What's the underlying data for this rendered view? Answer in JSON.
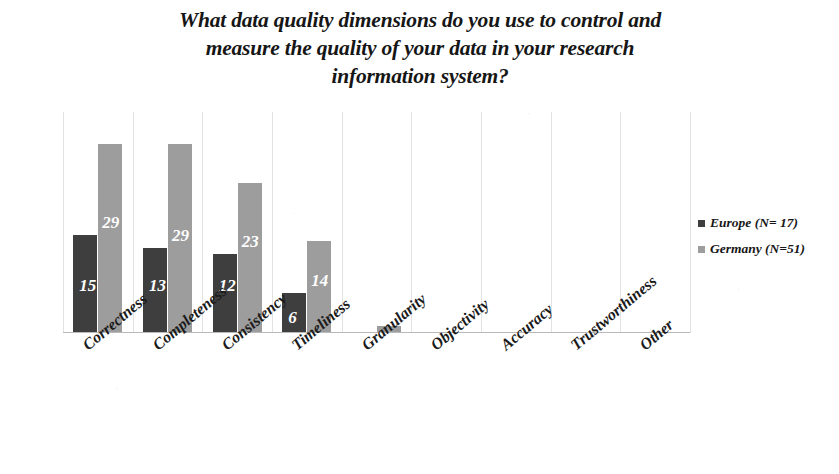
{
  "chart_data": {
    "type": "bar",
    "title": "What data quality dimensions do you use to control and\nmeasure the quality of your data in your research\ninformation system?",
    "xlabel": "",
    "ylabel": "",
    "ylim": [
      0,
      34
    ],
    "grid": "vertical-category-separators",
    "legend_position": "right",
    "categories": [
      "Correctness",
      "Completeness",
      "Consistency",
      "Timeliness",
      "Granularity",
      "Objectivity",
      "Accuracy",
      "Trustworthiness",
      "Other"
    ],
    "series": [
      {
        "name": "Europe (N= 17)",
        "color": "#3e3e3e",
        "values": [
          15,
          13,
          12,
          6,
          0,
          0,
          0,
          0,
          0
        ],
        "labels": [
          "15",
          "13",
          "12",
          "6",
          "",
          "",
          "",
          "",
          ""
        ]
      },
      {
        "name": "Germany (N=51)",
        "color": "#9d9d9d",
        "values": [
          29,
          29,
          23,
          14,
          1,
          0,
          0,
          0,
          0
        ],
        "labels": [
          "29",
          "29",
          "23",
          "14",
          "",
          "",
          "",
          "",
          ""
        ]
      }
    ]
  },
  "legend": {
    "items": [
      {
        "label": "Europe (N= 17)",
        "swatch": "europe"
      },
      {
        "label": "Germany (N=51)",
        "swatch": "germany"
      }
    ]
  }
}
